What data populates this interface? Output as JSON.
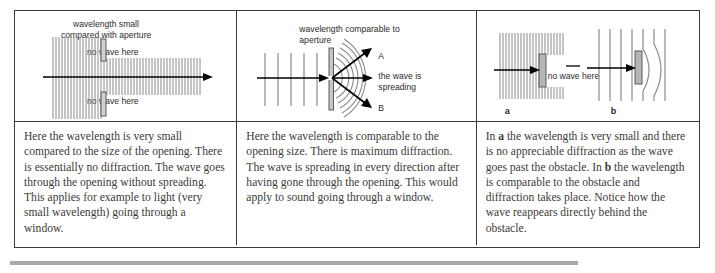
{
  "diagram": {
    "columns": [
      {
        "id": "small-wavelength-aperture",
        "figure_labels": {
          "heading_line1": "wavelength small",
          "heading_line2": "compared with aperture",
          "no_wave_top": "no wave here",
          "no_wave_bottom": "no wave here"
        },
        "caption": "Here the wavelength is very small compared to the size of the opening. There is essentially no diffraction. The wave goes through the opening without spreading. This applies for example to light (very small wavelength) going through a window."
      },
      {
        "id": "comparable-wavelength-aperture",
        "figure_labels": {
          "heading_line1": "wavelength comparable to",
          "heading_line2": "aperture",
          "ray_a": "A",
          "ray_b": "B",
          "spreading_line1": "the wave is",
          "spreading_line2": "spreading"
        },
        "caption": "Here the wavelength is comparable to the opening size. There is maximum diffraction. The wave is spreading in every direction after having gone through the opening. This would apply to sound going through a window."
      },
      {
        "id": "obstacle-comparison",
        "figure_labels": {
          "no_wave": "no wave here",
          "sub_a": "a",
          "sub_b": "b"
        },
        "caption_parts": {
          "p1": "In ",
          "b1": "a",
          "p2": " the wavelength is very small and there is no appreciable diffraction as the wave goes past the obstacle. In ",
          "b2": "b",
          "p3": " the wavelength is comparable to the obstacle and diffraction takes place. Notice how the wave reappears directly behind the obstacle."
        }
      }
    ],
    "colors": {
      "border": "#3a3a3a",
      "wave_line": "#8a8a8a",
      "barrier_fill": "#b5b5b5",
      "barrier_stroke": "#5a5a5a",
      "arrow": "#000000",
      "text": "#3c3a38",
      "footer_bar": "#a8a8a8"
    }
  }
}
